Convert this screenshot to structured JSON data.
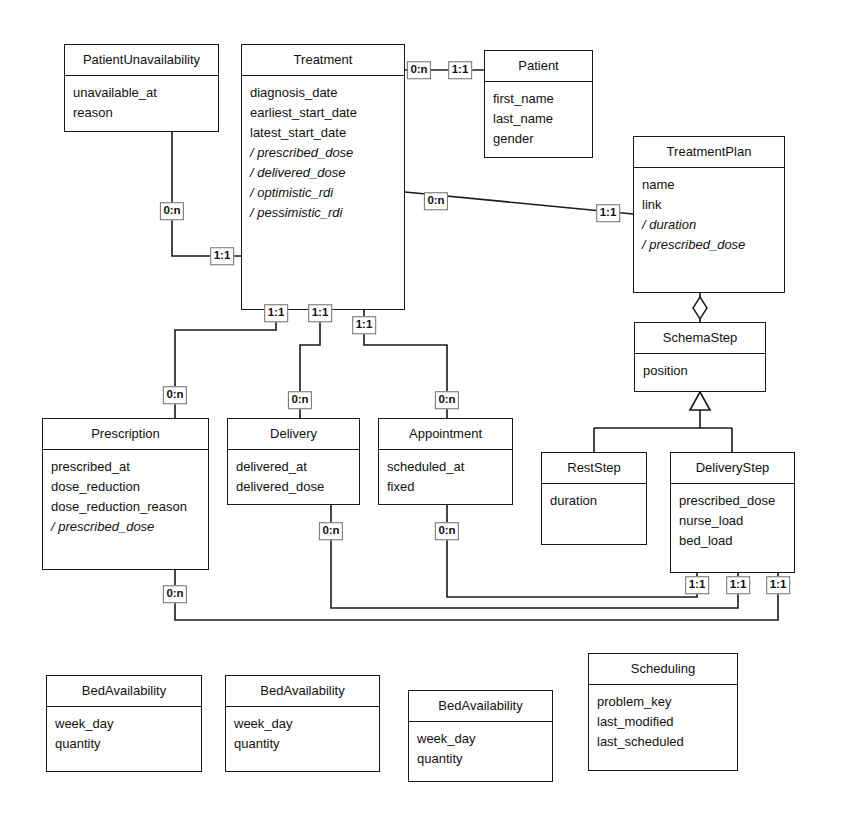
{
  "diagram": {
    "type": "uml-class-diagram",
    "width": 845,
    "height": 820,
    "line_color": "#1a1a1a",
    "background": "#ffffff"
  },
  "classes": [
    {
      "id": "patient-unavailability",
      "name": "PatientUnavailability",
      "x": 64,
      "y": 44,
      "w": 155,
      "h": 88,
      "attributes": [
        {
          "text": "unavailable_at",
          "derived": false
        },
        {
          "text": "reason",
          "derived": false
        }
      ]
    },
    {
      "id": "treatment",
      "name": "Treatment",
      "x": 241,
      "y": 44,
      "w": 164,
      "h": 266,
      "attributes": [
        {
          "text": "diagnosis_date",
          "derived": false
        },
        {
          "text": "earliest_start_date",
          "derived": false
        },
        {
          "text": "latest_start_date",
          "derived": false
        },
        {
          "text": "/ prescribed_dose",
          "derived": true
        },
        {
          "text": "/ delivered_dose",
          "derived": true
        },
        {
          "text": "/ optimistic_rdi",
          "derived": true
        },
        {
          "text": "/ pessimistic_rdi",
          "derived": true
        }
      ]
    },
    {
      "id": "patient",
      "name": "Patient",
      "x": 484,
      "y": 50,
      "w": 109,
      "h": 108,
      "attributes": [
        {
          "text": "first_name",
          "derived": false
        },
        {
          "text": "last_name",
          "derived": false
        },
        {
          "text": "gender",
          "derived": false
        }
      ]
    },
    {
      "id": "treatment-plan",
      "name": "TreatmentPlan",
      "x": 633,
      "y": 136,
      "w": 152,
      "h": 157,
      "attributes": [
        {
          "text": "name",
          "derived": false
        },
        {
          "text": "link",
          "derived": false
        },
        {
          "text": "/ duration",
          "derived": true
        },
        {
          "text": "/ prescribed_dose",
          "derived": true
        }
      ]
    },
    {
      "id": "schema-step",
      "name": "SchemaStep",
      "x": 634,
      "y": 322,
      "w": 132,
      "h": 70,
      "attributes": [
        {
          "text": "position",
          "derived": false
        }
      ]
    },
    {
      "id": "rest-step",
      "name": "RestStep",
      "x": 541,
      "y": 452,
      "w": 106,
      "h": 93,
      "attributes": [
        {
          "text": "duration",
          "derived": false
        }
      ]
    },
    {
      "id": "delivery-step",
      "name": "DeliveryStep",
      "x": 670,
      "y": 452,
      "w": 125,
      "h": 121,
      "attributes": [
        {
          "text": "prescribed_dose",
          "derived": false
        },
        {
          "text": "nurse_load",
          "derived": false
        },
        {
          "text": "bed_load",
          "derived": false
        }
      ]
    },
    {
      "id": "prescription",
      "name": "Prescription",
      "x": 42,
      "y": 418,
      "w": 167,
      "h": 152,
      "attributes": [
        {
          "text": "prescribed_at",
          "derived": false
        },
        {
          "text": "dose_reduction",
          "derived": false
        },
        {
          "text": "dose_reduction_reason",
          "derived": false
        },
        {
          "text": "/ prescribed_dose",
          "derived": true
        }
      ]
    },
    {
      "id": "delivery",
      "name": "Delivery",
      "x": 227,
      "y": 418,
      "w": 133,
      "h": 87,
      "attributes": [
        {
          "text": "delivered_at",
          "derived": false
        },
        {
          "text": "delivered_dose",
          "derived": false
        }
      ]
    },
    {
      "id": "appointment",
      "name": "Appointment",
      "x": 378,
      "y": 418,
      "w": 135,
      "h": 87,
      "attributes": [
        {
          "text": "scheduled_at",
          "derived": false
        },
        {
          "text": "fixed",
          "derived": false
        }
      ]
    },
    {
      "id": "bed-availability-1",
      "name": "BedAvailability",
      "x": 46,
      "y": 675,
      "w": 156,
      "h": 97,
      "attributes": [
        {
          "text": "week_day",
          "derived": false
        },
        {
          "text": "quantity",
          "derived": false
        }
      ]
    },
    {
      "id": "bed-availability-2",
      "name": "BedAvailability",
      "x": 225,
      "y": 675,
      "w": 155,
      "h": 97,
      "attributes": [
        {
          "text": "week_day",
          "derived": false
        },
        {
          "text": "quantity",
          "derived": false
        }
      ]
    },
    {
      "id": "bed-availability-3",
      "name": "BedAvailability",
      "x": 408,
      "y": 690,
      "w": 145,
      "h": 92,
      "attributes": [
        {
          "text": "week_day",
          "derived": false
        },
        {
          "text": "quantity",
          "derived": false
        }
      ]
    },
    {
      "id": "scheduling",
      "name": "Scheduling",
      "x": 588,
      "y": 653,
      "w": 150,
      "h": 118,
      "attributes": [
        {
          "text": "problem_key",
          "derived": false
        },
        {
          "text": "last_modified",
          "derived": false
        },
        {
          "text": "last_scheduled",
          "derived": false
        }
      ]
    }
  ],
  "multiplicities": [
    {
      "id": "m-pu-0n",
      "label": "0:n",
      "x": 172,
      "y": 211
    },
    {
      "id": "m-pu-11",
      "label": "1:1",
      "x": 222,
      "y": 256
    },
    {
      "id": "m-patient-0n",
      "label": "0:n",
      "x": 419,
      "y": 70
    },
    {
      "id": "m-patient-11",
      "label": "1:1",
      "x": 460,
      "y": 70
    },
    {
      "id": "m-plan-0n",
      "label": "0:n",
      "x": 436,
      "y": 201
    },
    {
      "id": "m-plan-11",
      "label": "1:1",
      "x": 608,
      "y": 213
    },
    {
      "id": "m-presc-11",
      "label": "1:1",
      "x": 276,
      "y": 313
    },
    {
      "id": "m-deliv-11",
      "label": "1:1",
      "x": 320,
      "y": 313
    },
    {
      "id": "m-appt-11",
      "label": "1:1",
      "x": 364,
      "y": 325
    },
    {
      "id": "m-presc-0n",
      "label": "0:n",
      "x": 175,
      "y": 395
    },
    {
      "id": "m-deliv-0n",
      "label": "0:n",
      "x": 300,
      "y": 400
    },
    {
      "id": "m-appt-0n",
      "label": "0:n",
      "x": 447,
      "y": 400
    },
    {
      "id": "m-presc-bot-0n",
      "label": "0:n",
      "x": 175,
      "y": 594
    },
    {
      "id": "m-deliv-bot-0n",
      "label": "0:n",
      "x": 331,
      "y": 531
    },
    {
      "id": "m-appt-bot-0n",
      "label": "0:n",
      "x": 447,
      "y": 531
    },
    {
      "id": "m-ds-11-a",
      "label": "1:1",
      "x": 697,
      "y": 585
    },
    {
      "id": "m-ds-11-b",
      "label": "1:1",
      "x": 738,
      "y": 585
    },
    {
      "id": "m-ds-11-c",
      "label": "1:1",
      "x": 778,
      "y": 585
    }
  ],
  "relationships": [
    {
      "id": "rel-treatment-patientunavailability",
      "from": "Treatment",
      "to": "PatientUnavailability",
      "kind": "association",
      "from_mult": "1:1",
      "to_mult": "0:n"
    },
    {
      "id": "rel-treatment-patient",
      "from": "Treatment",
      "to": "Patient",
      "kind": "association",
      "from_mult": "0:n",
      "to_mult": "1:1"
    },
    {
      "id": "rel-treatment-treatmentplan",
      "from": "Treatment",
      "to": "TreatmentPlan",
      "kind": "association",
      "from_mult": "0:n",
      "to_mult": "1:1"
    },
    {
      "id": "rel-treatmentplan-schemastep",
      "from": "TreatmentPlan",
      "to": "SchemaStep",
      "kind": "aggregation"
    },
    {
      "id": "rel-schemastep-reststep",
      "from": "SchemaStep",
      "to": "RestStep",
      "kind": "generalization"
    },
    {
      "id": "rel-schemastep-deliverystep",
      "from": "SchemaStep",
      "to": "DeliveryStep",
      "kind": "generalization"
    },
    {
      "id": "rel-treatment-prescription",
      "from": "Treatment",
      "to": "Prescription",
      "kind": "association",
      "from_mult": "1:1",
      "to_mult": "0:n"
    },
    {
      "id": "rel-treatment-delivery",
      "from": "Treatment",
      "to": "Delivery",
      "kind": "association",
      "from_mult": "1:1",
      "to_mult": "0:n"
    },
    {
      "id": "rel-treatment-appointment",
      "from": "Treatment",
      "to": "Appointment",
      "kind": "association",
      "from_mult": "1:1",
      "to_mult": "0:n"
    },
    {
      "id": "rel-deliverystep-prescription",
      "from": "DeliveryStep",
      "to": "Prescription",
      "kind": "association",
      "from_mult": "1:1",
      "to_mult": "0:n"
    },
    {
      "id": "rel-deliverystep-delivery",
      "from": "DeliveryStep",
      "to": "Delivery",
      "kind": "association",
      "from_mult": "1:1",
      "to_mult": "0:n"
    },
    {
      "id": "rel-deliverystep-appointment",
      "from": "DeliveryStep",
      "to": "Appointment",
      "kind": "association",
      "from_mult": "1:1",
      "to_mult": "0:n"
    }
  ]
}
